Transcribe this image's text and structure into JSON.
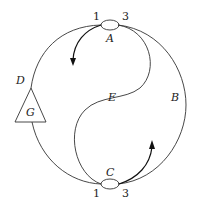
{
  "diagram": {
    "nodes": {
      "A": {
        "label": "A",
        "port_left": "1",
        "port_right": "3"
      },
      "C": {
        "label": "C",
        "port_left": "1",
        "port_right": "3"
      }
    },
    "branches": {
      "B": "B",
      "D": "D",
      "E": "E"
    },
    "element": {
      "label": "G",
      "shape": "triangle"
    },
    "arrows": [
      {
        "name": "arrow-from-A",
        "direction": "down-left"
      },
      {
        "name": "arrow-from-C",
        "direction": "up"
      }
    ]
  }
}
